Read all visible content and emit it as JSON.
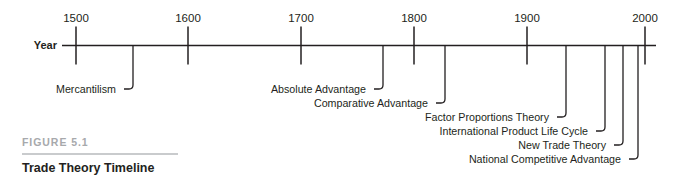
{
  "figure": {
    "number_label": "FIGURE 5.1",
    "title": "Trade Theory Timeline",
    "axis_name": "Year"
  },
  "colors": {
    "ink": "#231f20",
    "caption_gray": "#a7a9ac",
    "rule_gray": "#c9cbcd",
    "background": "#ffffff"
  },
  "chart_data": {
    "type": "timeline",
    "title": "Trade Theory Timeline",
    "xlabel": "Year",
    "axis_range": [
      1450,
      2015
    ],
    "grid": false,
    "legend": false,
    "tick_labels": [
      "1500",
      "1600",
      "1700",
      "1800",
      "1900",
      "2000"
    ],
    "ticks": [
      {
        "label": "1500",
        "value": 1500,
        "x": 76
      },
      {
        "label": "1600",
        "value": 1600,
        "x": 188
      },
      {
        "label": "1700",
        "value": 1700,
        "x": 301
      },
      {
        "label": "1800",
        "value": 1800,
        "x": 414
      },
      {
        "label": "1900",
        "value": 1900,
        "x": 527
      },
      {
        "label": "2000",
        "value": 2000,
        "x": 645
      }
    ],
    "events": [
      {
        "label": "Mercantilism",
        "leader_x": 133,
        "label_x": 125,
        "label_y": 93,
        "elbow_y": 89,
        "row": 1
      },
      {
        "label": "Absolute Advantage",
        "leader_x": 383,
        "label_x": 375,
        "label_y": 93,
        "elbow_y": 89,
        "row": 1
      },
      {
        "label": "Comparative Advantage",
        "leader_x": 445,
        "label_x": 437,
        "label_y": 107,
        "elbow_y": 103,
        "row": 2
      },
      {
        "label": "Factor Proportions Theory",
        "leader_x": 566,
        "label_x": 558,
        "label_y": 121,
        "elbow_y": 117,
        "row": 3
      },
      {
        "label": "International Product Life Cycle",
        "leader_x": 605,
        "label_x": 597,
        "label_y": 135,
        "elbow_y": 131,
        "row": 4
      },
      {
        "label": "New Trade Theory",
        "leader_x": 623,
        "label_x": 615,
        "label_y": 149,
        "elbow_y": 145,
        "row": 5
      },
      {
        "label": "National Competitive Advantage",
        "leader_x": 638,
        "label_x": 630,
        "label_y": 163,
        "elbow_y": 159,
        "row": 6
      }
    ]
  }
}
